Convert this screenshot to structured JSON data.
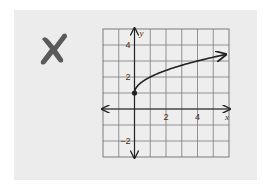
{
  "marker": {
    "icon": "x-mark-icon",
    "color": "#5a5a5a",
    "meaning": "incorrect"
  },
  "colors": {
    "page_bg": "#ffffff",
    "card_bg": "#ececec",
    "grid": "#7a7a7a",
    "axis": "#222222",
    "curve": "#222222"
  },
  "chart_data": {
    "type": "line",
    "title": "",
    "function": "y = sqrt(x) + 1",
    "xlabel": "x",
    "ylabel": "y",
    "xlim": [
      -2,
      6
    ],
    "ylim": [
      -3,
      5
    ],
    "grid": true,
    "x_ticks": [
      {
        "value": 2,
        "label": "2"
      },
      {
        "value": 4,
        "label": "4"
      }
    ],
    "y_ticks": [
      {
        "value": 4,
        "label": "4"
      },
      {
        "value": 2,
        "label": "2"
      },
      {
        "value": -2,
        "label": "−2"
      }
    ],
    "series": [
      {
        "name": "curve",
        "start_point": {
          "x": 0,
          "y": 1,
          "closed": true
        },
        "end_arrow": true,
        "x": [
          0,
          0.25,
          0.5,
          1,
          2,
          3,
          4,
          5,
          5.8
        ],
        "y": [
          1,
          1.5,
          1.71,
          2,
          2.41,
          2.73,
          3,
          3.24,
          3.41
        ]
      }
    ],
    "legend": null
  }
}
